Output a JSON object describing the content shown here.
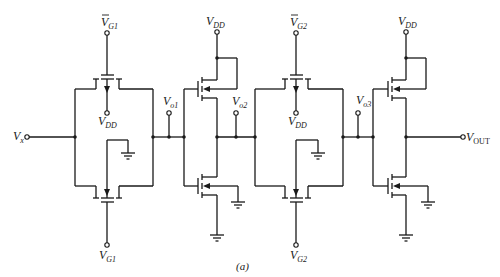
{
  "figure": {
    "caption": "(a)",
    "top_cut_text": "...",
    "labels": {
      "vg1_bar_top": {
        "main": "V",
        "sub": "G1",
        "overbar": true
      },
      "vg1_bottom": {
        "main": "V",
        "sub": "G1"
      },
      "vg2_bar_top": {
        "main": "V",
        "sub": "G2",
        "overbar": true
      },
      "vg2_bottom": {
        "main": "V",
        "sub": "G2"
      },
      "vdd_1": {
        "main": "V",
        "sub": "DD"
      },
      "vdd_2": {
        "main": "V",
        "sub": "DD"
      },
      "vdd_3": {
        "main": "V",
        "sub": "DD"
      },
      "vdd_4": {
        "main": "V",
        "sub": "DD"
      },
      "vx": {
        "main": "V",
        "sub": "x"
      },
      "vo1": {
        "main": "V",
        "sub": "o1"
      },
      "vo2": {
        "main": "V",
        "sub": "o2"
      },
      "vo3": {
        "main": "V",
        "sub": "o3"
      },
      "vout": {
        "main": "V",
        "sub": "OUT"
      }
    },
    "components": [
      {
        "id": "transmission-gate-1",
        "type": "CMOS transmission gate",
        "gates": [
          "VG1 bar",
          "VG1"
        ]
      },
      {
        "id": "inverter-1",
        "type": "CMOS inverter",
        "input": "Vo1",
        "output": "Vo2"
      },
      {
        "id": "transmission-gate-2",
        "type": "CMOS transmission gate",
        "gates": [
          "VG2 bar",
          "VG2"
        ]
      },
      {
        "id": "inverter-2",
        "type": "CMOS inverter",
        "input": "Vo3",
        "output": "VOUT"
      }
    ],
    "colors": {
      "ink": "#1a1a1a",
      "background": "#ffffff"
    }
  }
}
